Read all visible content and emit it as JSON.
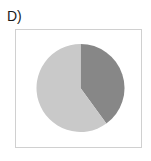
{
  "figure": {
    "panel_label": "D)",
    "frame_color": "#d0d0d0",
    "background_color": "#ffffff"
  },
  "chart_data": {
    "type": "pie",
    "title": "D)",
    "xlabel": "",
    "ylabel": "",
    "categories": [
      "Segment 1",
      "Segment 2"
    ],
    "values": [
      40,
      60
    ],
    "value_unit": "percent",
    "colors": [
      "#878787",
      "#c9c9c9"
    ],
    "start_angle_deg": 0,
    "direction": "clockwise",
    "legend": "none",
    "grid": false,
    "labels_shown": false,
    "slices": [
      {
        "name": "Segment 1",
        "value": 40,
        "color": "#878787",
        "start_angle_deg": 0,
        "end_angle_deg": 144
      },
      {
        "name": "Segment 2",
        "value": 60,
        "color": "#c9c9c9",
        "start_angle_deg": 144,
        "end_angle_deg": 360
      }
    ],
    "geometry": {
      "center_x": 65.5,
      "center_y": 59,
      "radius": 44
    }
  }
}
